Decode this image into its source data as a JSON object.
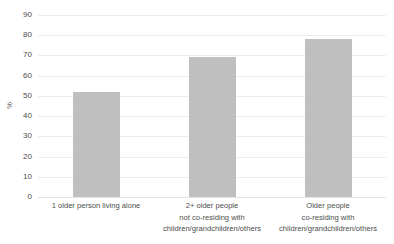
{
  "chart_data": {
    "type": "bar",
    "title": "",
    "subtitle": "",
    "xlabel": "",
    "ylabel": "%",
    "ylim": [
      0,
      90
    ],
    "ytick_step": 10,
    "yticks": [
      90,
      80,
      70,
      60,
      50,
      40,
      30,
      20,
      10,
      0
    ],
    "ytick_labels": [
      "90",
      "80",
      "70",
      "60",
      "50",
      "40",
      "30",
      "20",
      "10",
      "0"
    ],
    "grid": true,
    "legend": false,
    "legend_position": "none",
    "bar_color": "#bfbfbf",
    "categories": [
      "1 older person living alone",
      "2+ older people not co-residing with children/grandchildren/others",
      "Older people co-residing with children/grandchildren/others"
    ],
    "category_lines": [
      [
        "1 older person living alone"
      ],
      [
        "2+ older people",
        "not co-residing with",
        "children/grandchildren/others"
      ],
      [
        "Older people",
        "co-residing with",
        "children/grandchildren/others"
      ]
    ],
    "values": [
      52,
      69,
      78
    ]
  }
}
